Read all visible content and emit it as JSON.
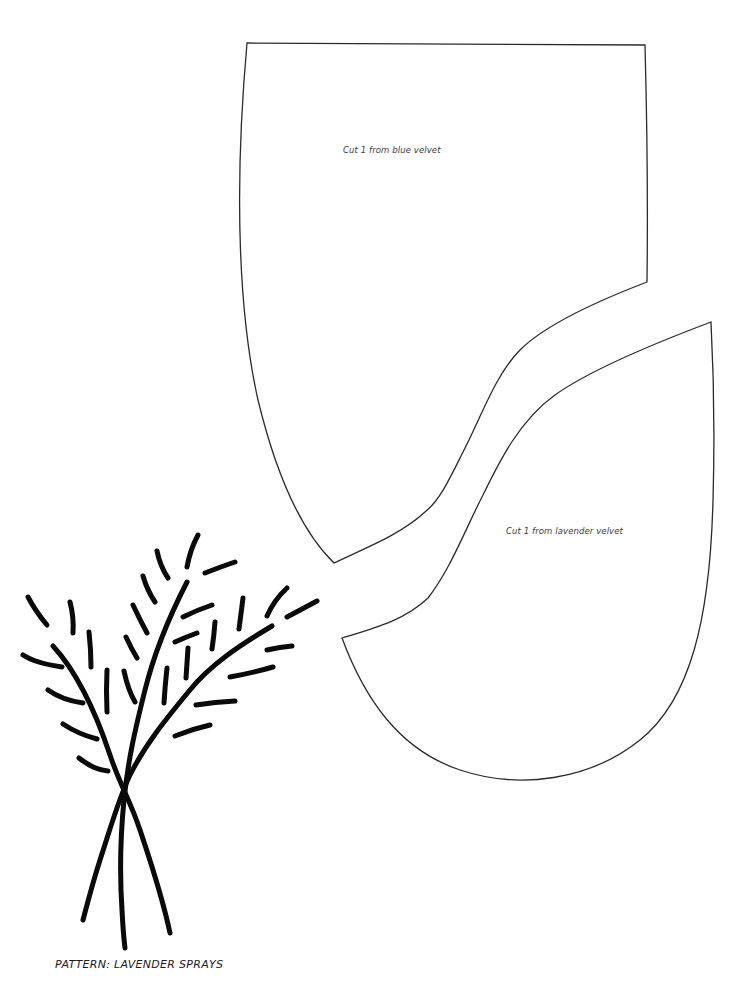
{
  "document": {
    "type": "sewing pattern",
    "background_color": "#ffffff",
    "line_color": "#2b2b2b",
    "ink_color": "#0a0a0a"
  },
  "pattern_pieces": [
    {
      "id": "blue",
      "instruction": "Cut 1 from blue velvet"
    },
    {
      "id": "lavender",
      "instruction": "Cut 1 from lavender velvet"
    }
  ],
  "illustration": {
    "subject": "lavender-sprays",
    "stems": 3,
    "leaf_dashes": 27
  },
  "caption": "PATTERN: LAVENDER SPRAYS"
}
